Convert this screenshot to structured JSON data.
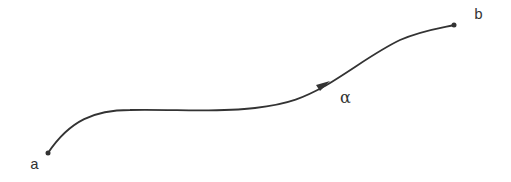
{
  "diagram": {
    "type": "parametrized curve from a to b",
    "stroke_color": "#333333",
    "labels": {
      "start": "a",
      "end": "b",
      "curve": "α"
    },
    "points": {
      "start": [
        48,
        153
      ],
      "end": [
        454,
        25
      ]
    },
    "arrow": {
      "position": [
        322,
        86
      ],
      "direction": "forward"
    }
  }
}
